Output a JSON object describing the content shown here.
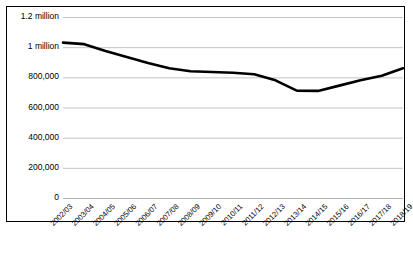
{
  "chart_data": {
    "type": "line",
    "title": "",
    "subtitle": "",
    "xlabel": "",
    "ylabel": "",
    "grid": true,
    "legend": false,
    "legend_position": "none",
    "ylim": [
      0,
      1200000
    ],
    "ytick_values": [
      0,
      200000,
      400000,
      600000,
      800000,
      1000000,
      1200000
    ],
    "ytick_labels": [
      "0",
      "200,000",
      "400,000",
      "600,000",
      "800,000",
      "1 million",
      "1.2 million"
    ],
    "categories": [
      "2002/03",
      "2003/04",
      "2004/05",
      "2005/06",
      "2006/07",
      "2007/08",
      "2008/09",
      "2009/10",
      "2010/11",
      "2011/12",
      "2012/13",
      "2013/14",
      "2014/15",
      "2015/16",
      "2016/17",
      "2017/18",
      "2018/19"
    ],
    "values": [
      1030000,
      1020000,
      975000,
      935000,
      895000,
      860000,
      840000,
      835000,
      830000,
      820000,
      780000,
      712000,
      710000,
      745000,
      780000,
      810000,
      860000
    ],
    "series": [
      {
        "name": "",
        "color": "#000000",
        "values": [
          1030000,
          1020000,
          975000,
          935000,
          895000,
          860000,
          840000,
          835000,
          830000,
          820000,
          780000,
          712000,
          710000,
          745000,
          780000,
          810000,
          860000
        ]
      }
    ],
    "colors": {
      "line": "#000000",
      "grid": "#b4b4b4",
      "axis": "#000000",
      "background": "#ffffff",
      "border": "#000000"
    }
  }
}
